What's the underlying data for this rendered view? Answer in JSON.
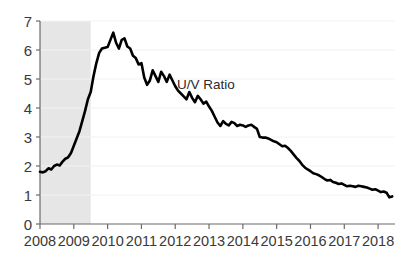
{
  "chart_data": {
    "type": "line",
    "title": "",
    "subtitle": "",
    "xlabel": "",
    "ylabel": "",
    "xlim": [
      2008.0,
      2018.5
    ],
    "ylim": [
      0,
      7
    ],
    "grid": true,
    "grid_axis": "y",
    "legend_position": "inline-annotation",
    "x_tick_labels": [
      "2008",
      "2009",
      "2010",
      "2011",
      "2012",
      "2013",
      "2014",
      "2015",
      "2016",
      "2017",
      "2018"
    ],
    "x_ticks": [
      2008,
      2009,
      2010,
      2011,
      2012,
      2013,
      2014,
      2015,
      2016,
      2017,
      2018
    ],
    "y_tick_labels": [
      "0",
      "1",
      "2",
      "3",
      "4",
      "5",
      "6",
      "7"
    ],
    "y_ticks": [
      0,
      1,
      2,
      3,
      4,
      5,
      6,
      7
    ],
    "annotations": [
      {
        "text": "U/V Ratio",
        "x": 2012.05,
        "y": 4.65
      }
    ],
    "shaded_regions": [
      {
        "name": "recession-band",
        "x_start": 2008.0,
        "x_end": 2009.5,
        "color": "#e6e6e6"
      }
    ],
    "series": [
      {
        "name": "U/V Ratio",
        "color": "#000000",
        "line_width": 2.6,
        "x": [
          2008.0,
          2008.083,
          2008.167,
          2008.25,
          2008.333,
          2008.417,
          2008.5,
          2008.583,
          2008.667,
          2008.75,
          2008.833,
          2008.917,
          2009.0,
          2009.083,
          2009.167,
          2009.25,
          2009.333,
          2009.417,
          2009.5,
          2009.583,
          2009.667,
          2009.75,
          2009.833,
          2009.917,
          2010.0,
          2010.083,
          2010.167,
          2010.25,
          2010.333,
          2010.417,
          2010.5,
          2010.583,
          2010.667,
          2010.75,
          2010.833,
          2010.917,
          2011.0,
          2011.083,
          2011.167,
          2011.25,
          2011.333,
          2011.417,
          2011.5,
          2011.583,
          2011.667,
          2011.75,
          2011.833,
          2011.917,
          2012.0,
          2012.083,
          2012.167,
          2012.25,
          2012.333,
          2012.417,
          2012.5,
          2012.583,
          2012.667,
          2012.75,
          2012.833,
          2012.917,
          2013.0,
          2013.083,
          2013.167,
          2013.25,
          2013.333,
          2013.417,
          2013.5,
          2013.583,
          2013.667,
          2013.75,
          2013.833,
          2013.917,
          2014.0,
          2014.083,
          2014.167,
          2014.25,
          2014.333,
          2014.417,
          2014.5,
          2014.583,
          2014.667,
          2014.75,
          2014.833,
          2014.917,
          2015.0,
          2015.083,
          2015.167,
          2015.25,
          2015.333,
          2015.417,
          2015.5,
          2015.583,
          2015.667,
          2015.75,
          2015.833,
          2015.917,
          2016.0,
          2016.083,
          2016.167,
          2016.25,
          2016.333,
          2016.417,
          2016.5,
          2016.583,
          2016.667,
          2016.75,
          2016.833,
          2016.917,
          2017.0,
          2017.083,
          2017.167,
          2017.25,
          2017.333,
          2017.417,
          2017.5,
          2017.583,
          2017.667,
          2017.75,
          2017.833,
          2017.917,
          2018.0,
          2018.083,
          2018.167,
          2018.25,
          2018.333,
          2018.417
        ],
        "values": [
          1.8,
          1.78,
          1.82,
          1.92,
          1.88,
          2.0,
          2.05,
          2.02,
          2.15,
          2.25,
          2.3,
          2.45,
          2.7,
          2.95,
          3.2,
          3.55,
          3.9,
          4.3,
          4.55,
          5.1,
          5.55,
          5.9,
          6.05,
          6.08,
          6.1,
          6.35,
          6.6,
          6.25,
          6.05,
          6.35,
          6.4,
          6.12,
          6.05,
          5.8,
          5.72,
          5.5,
          5.55,
          5.05,
          4.8,
          4.95,
          5.3,
          5.1,
          4.9,
          5.25,
          5.1,
          4.9,
          5.15,
          4.95,
          4.75,
          4.6,
          4.5,
          4.4,
          4.3,
          4.55,
          4.35,
          4.2,
          4.42,
          4.3,
          4.15,
          4.22,
          4.05,
          3.9,
          3.7,
          3.5,
          3.38,
          3.55,
          3.45,
          3.4,
          3.52,
          3.48,
          3.38,
          3.42,
          3.4,
          3.35,
          3.4,
          3.42,
          3.35,
          3.28,
          3.0,
          2.98,
          2.98,
          2.95,
          2.9,
          2.85,
          2.82,
          2.75,
          2.68,
          2.7,
          2.62,
          2.52,
          2.4,
          2.28,
          2.18,
          2.05,
          1.95,
          1.88,
          1.82,
          1.75,
          1.72,
          1.68,
          1.62,
          1.55,
          1.5,
          1.52,
          1.45,
          1.42,
          1.38,
          1.4,
          1.35,
          1.3,
          1.32,
          1.3,
          1.28,
          1.32,
          1.3,
          1.28,
          1.26,
          1.22,
          1.18,
          1.2,
          1.15,
          1.1,
          1.12,
          1.08,
          0.92,
          0.95
        ]
      }
    ]
  },
  "axes": {
    "x_axis_name": "year-axis",
    "y_axis_name": "ratio-axis"
  },
  "colors": {
    "line": "#000000",
    "shading": "#e6e6e6",
    "gridline": "#f2f2f4",
    "axis": "#6b6b6b",
    "text": "#3a3a3a"
  }
}
